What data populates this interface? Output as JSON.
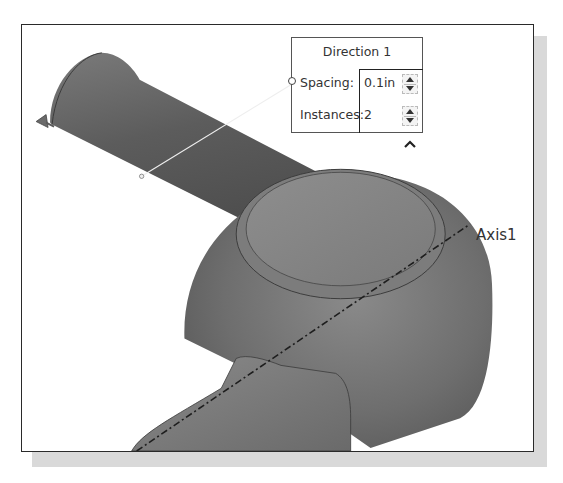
{
  "dialog": {
    "title": "Direction 1",
    "rows": [
      {
        "label": "Spacing:",
        "value": "0.1in"
      },
      {
        "label": "Instances:",
        "value": "2"
      }
    ],
    "collapse_glyph": "^"
  },
  "viewport": {
    "axis_label": "Axis1",
    "colors": {
      "body": "#6a6a6a",
      "body_light": "#8c8c8c",
      "body_dark": "#4a4a4a",
      "edge": "#2a2a2a"
    }
  }
}
